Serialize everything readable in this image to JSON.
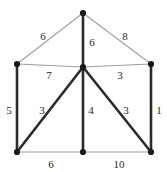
{
  "figure": {
    "kind": "weighted-undirected-graph",
    "background_color": "#ffffff",
    "width": 167,
    "height": 172,
    "label_color": "#262626",
    "node_color": "#1a1a1a",
    "thick_edge_color": "#2b2b2b",
    "thin_edge_color": "#9e9e9e"
  },
  "chart_data": {
    "type": "diagram",
    "title": "",
    "nodes": [
      {
        "id": "apex",
        "name": "apex-node",
        "x": 83,
        "y": 13
      },
      {
        "id": "left-mid",
        "name": "left-mid-node",
        "x": 17,
        "y": 64
      },
      {
        "id": "center",
        "name": "center-node",
        "x": 83,
        "y": 67
      },
      {
        "id": "right-mid",
        "name": "right-mid-node",
        "x": 151,
        "y": 64
      },
      {
        "id": "bottom-left",
        "name": "bottom-left-node",
        "x": 17,
        "y": 152
      },
      {
        "id": "bottom-mid",
        "name": "bottom-mid-node",
        "x": 83,
        "y": 152
      },
      {
        "id": "bottom-right",
        "name": "bottom-right-node",
        "x": 151,
        "y": 152
      }
    ],
    "edges": [
      {
        "id": "e-apex-left-mid",
        "from": "apex",
        "to": "left-mid",
        "weight": 6,
        "style": "thin",
        "label_x": 43,
        "label_y": 36
      },
      {
        "id": "e-apex-right-mid",
        "from": "apex",
        "to": "right-mid",
        "weight": 8,
        "style": "thin",
        "label_x": 125,
        "label_y": 36
      },
      {
        "id": "e-apex-center",
        "from": "apex",
        "to": "center",
        "weight": 6,
        "style": "thick",
        "label_x": 92,
        "label_y": 42
      },
      {
        "id": "e-left-mid-center",
        "from": "left-mid",
        "to": "center",
        "weight": 7,
        "style": "thin",
        "label_x": 49,
        "label_y": 75
      },
      {
        "id": "e-center-right-mid",
        "from": "center",
        "to": "right-mid",
        "weight": 3,
        "style": "thin",
        "label_x": 120,
        "label_y": 75
      },
      {
        "id": "e-left-mid-bottom-left",
        "from": "left-mid",
        "to": "bottom-left",
        "weight": 5,
        "style": "thick",
        "label_x": 9,
        "label_y": 110
      },
      {
        "id": "e-center-bottom-left",
        "from": "center",
        "to": "bottom-left",
        "weight": 3,
        "style": "thick",
        "label_x": 42,
        "label_y": 110
      },
      {
        "id": "e-center-bottom-mid",
        "from": "center",
        "to": "bottom-mid",
        "weight": 4,
        "style": "thick",
        "label_x": 91,
        "label_y": 110
      },
      {
        "id": "e-center-bottom-right",
        "from": "center",
        "to": "bottom-right",
        "weight": 3,
        "style": "thick",
        "label_x": 126,
        "label_y": 110
      },
      {
        "id": "e-right-mid-bottom-right",
        "from": "right-mid",
        "to": "bottom-right",
        "weight": 1,
        "style": "thick",
        "label_x": 159,
        "label_y": 110
      },
      {
        "id": "e-bottom-left-bottom-mid",
        "from": "bottom-left",
        "to": "bottom-mid",
        "weight": 6,
        "style": "thin",
        "label_x": 51,
        "label_y": 164
      },
      {
        "id": "e-bottom-mid-bottom-right",
        "from": "bottom-mid",
        "to": "bottom-right",
        "weight": 10,
        "style": "thin",
        "label_x": 119,
        "label_y": 164
      }
    ],
    "weights": [
      6,
      8,
      6,
      7,
      3,
      5,
      3,
      4,
      3,
      1,
      6,
      10
    ]
  }
}
